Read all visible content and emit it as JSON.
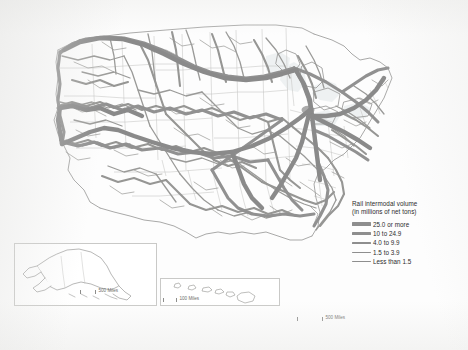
{
  "map": {
    "title": "United States rail intermodal volume map",
    "legend": {
      "title_line_1": "Rail intermodal volume",
      "title_line_2": "(in millions of net tons)",
      "classes": [
        {
          "label": "25.0 or more",
          "weight_class": "sw-1",
          "color": "#8e8e8e"
        },
        {
          "label": "10 to 24.9",
          "weight_class": "sw-2",
          "color": "#8e8e8e"
        },
        {
          "label": "4.0 to 9.9",
          "weight_class": "sw-3",
          "color": "#8e8e8e"
        },
        {
          "label": "1.5 to 3.9",
          "weight_class": "sw-4",
          "color": "#8e8e8e"
        },
        {
          "label": "Less than 1.5",
          "weight_class": "sw-5",
          "color": "#8e8e8e"
        }
      ]
    },
    "scalebars": [
      {
        "name": "main",
        "label": "500 Miles"
      },
      {
        "name": "alaska",
        "label": "500 Miles"
      },
      {
        "name": "hawaii",
        "label": "100 Miles"
      }
    ],
    "insets": [
      {
        "name": "alaska",
        "label": "Alaska"
      },
      {
        "name": "hawaii",
        "label": "Hawaii"
      }
    ],
    "colors": {
      "corridor": "#8e8e8e",
      "state_border": "#c4c4c2",
      "coastline": "#9a9a98",
      "water": "#eef1f2",
      "background": "#ffffff",
      "frame": "#c9c9c7"
    }
  }
}
